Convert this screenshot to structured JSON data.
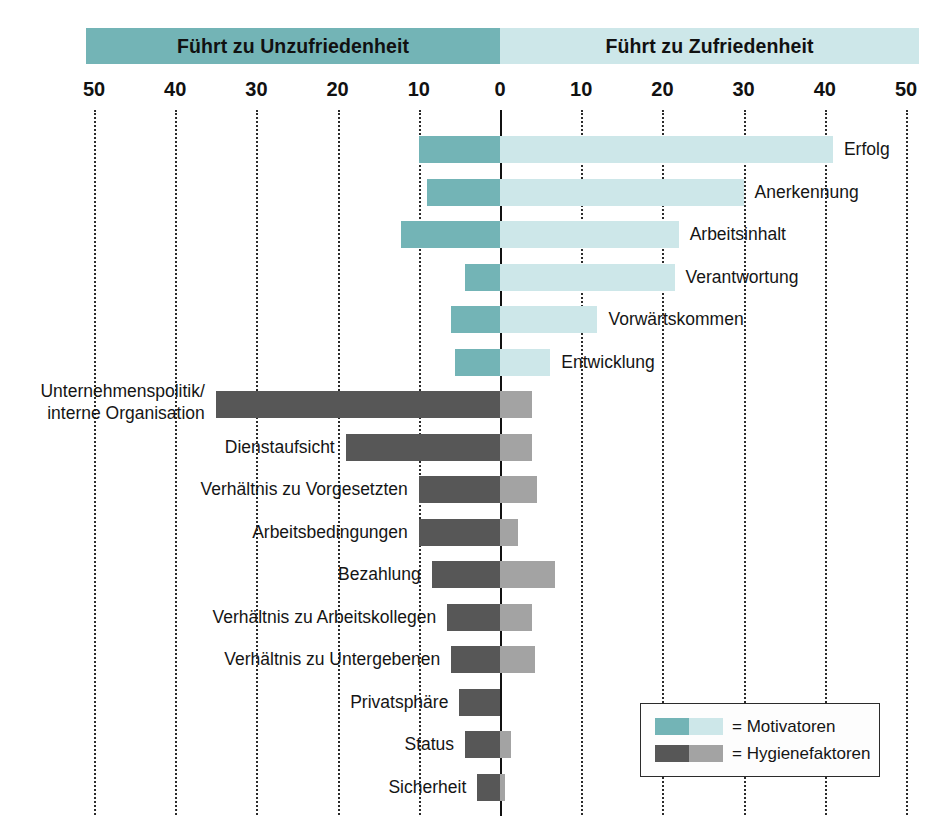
{
  "chart_data": {
    "type": "bar",
    "subtype": "diverging-horizontal-bar",
    "title": "",
    "xlabel": "",
    "ylabel": "",
    "xlim": [
      -50,
      50
    ],
    "grid": true,
    "grid_style": "dotted-vertical",
    "axis_ticks": [
      {
        "label": "50",
        "value": -50
      },
      {
        "label": "40",
        "value": -40
      },
      {
        "label": "30",
        "value": -30
      },
      {
        "label": "20",
        "value": -20
      },
      {
        "label": "10",
        "value": -10
      },
      {
        "label": "0",
        "value": 0
      },
      {
        "label": "10",
        "value": 10
      },
      {
        "label": "20",
        "value": 20
      },
      {
        "label": "30",
        "value": 30
      },
      {
        "label": "40",
        "value": 40
      },
      {
        "label": "50",
        "value": 50
      }
    ],
    "band_left_label": "Führt zu Unzufriedenheit",
    "band_right_label": "Führt zu Zufriedenheit",
    "colors": {
      "motivator_dark": "#73b4b6",
      "motivator_light": "#cde7e9",
      "hygiene_dark": "#575757",
      "hygiene_light": "#a3a3a3",
      "band_left": "#73b4b6",
      "band_right": "#cde7e9",
      "axis": "#111111",
      "grid": "#2b2b2b"
    },
    "categories": [
      "Erfolg",
      "Anerkennung",
      "Arbeitsinhalt",
      "Verantwortung",
      "Vorwärtskommen",
      "Entwicklung",
      "Unternehmenspolitik/ interne Organisation",
      "Dienstaufsicht",
      "Verhältnis zu Vorgesetzten",
      "Arbeitsbedingungen",
      "Bezahlung",
      "Verhältnis zu Arbeitskollegen",
      "Verhältnis zu Untergebenen",
      "Privatsphäre",
      "Status",
      "Sicherheit"
    ],
    "series": [
      {
        "name": "Führt zu Unzufriedenheit",
        "values": [
          10.0,
          9.0,
          12.2,
          4.3,
          6.0,
          5.5,
          35.0,
          19.0,
          10.0,
          10.0,
          8.4,
          6.5,
          6.0,
          5.0,
          4.3,
          2.8
        ]
      },
      {
        "name": "Führt zu Zufriedenheit",
        "values": [
          41.0,
          30.0,
          22.0,
          21.5,
          12.0,
          6.2,
          3.9,
          3.9,
          4.6,
          2.2,
          6.8,
          3.9,
          4.3,
          0.0,
          1.4,
          0.6
        ]
      }
    ],
    "legend": {
      "position": "bottom-right",
      "entries": [
        {
          "label": "= Motivatoren",
          "dark": "#73b4b6",
          "light": "#cde7e9"
        },
        {
          "label": "= Hygienefaktoren",
          "dark": "#575757",
          "light": "#a3a3a3"
        }
      ]
    },
    "bars": [
      {
        "label": "Erfolg",
        "group": "motivator",
        "left": 10.0,
        "right": 41.0,
        "label_side": "right"
      },
      {
        "label": "Anerkennung",
        "group": "motivator",
        "left": 9.0,
        "right": 30.0,
        "label_side": "right"
      },
      {
        "label": "Arbeitsinhalt",
        "group": "motivator",
        "left": 12.2,
        "right": 22.0,
        "label_side": "right"
      },
      {
        "label": "Verantwortung",
        "group": "motivator",
        "left": 4.3,
        "right": 21.5,
        "label_side": "right"
      },
      {
        "label": "Vorwärtskommen",
        "group": "motivator",
        "left": 6.0,
        "right": 12.0,
        "label_side": "right"
      },
      {
        "label": "Entwicklung",
        "group": "motivator",
        "left": 5.5,
        "right": 6.2,
        "label_side": "right"
      },
      {
        "label": "Unternehmenspolitik/ interne Organisation",
        "group": "hygiene",
        "left": 35.0,
        "right": 3.9,
        "label_side": "left"
      },
      {
        "label": "Dienstaufsicht",
        "group": "hygiene",
        "left": 19.0,
        "right": 3.9,
        "label_side": "left"
      },
      {
        "label": "Verhältnis zu Vorgesetzten",
        "group": "hygiene",
        "left": 10.0,
        "right": 4.6,
        "label_side": "left"
      },
      {
        "label": "Arbeitsbedingungen",
        "group": "hygiene",
        "left": 10.0,
        "right": 2.2,
        "label_side": "left"
      },
      {
        "label": "Bezahlung",
        "group": "hygiene",
        "left": 8.4,
        "right": 6.8,
        "label_side": "left"
      },
      {
        "label": "Verhältnis zu Arbeitskollegen",
        "group": "hygiene",
        "left": 6.5,
        "right": 3.9,
        "label_side": "left"
      },
      {
        "label": "Verhältnis zu Untergebenen",
        "group": "hygiene",
        "left": 6.0,
        "right": 4.3,
        "label_side": "left"
      },
      {
        "label": "Privatsphäre",
        "group": "hygiene",
        "left": 5.0,
        "right": 0.0,
        "label_side": "left"
      },
      {
        "label": "Status",
        "group": "hygiene",
        "left": 4.3,
        "right": 1.4,
        "label_side": "left"
      },
      {
        "label": "Sicherheit",
        "group": "hygiene",
        "left": 2.8,
        "right": 0.6,
        "label_side": "left"
      }
    ],
    "labels_multiline": {
      "Unternehmenspolitik/ interne Organisation": [
        "Unternehmenspolitik/",
        "interne Organisation"
      ]
    }
  }
}
